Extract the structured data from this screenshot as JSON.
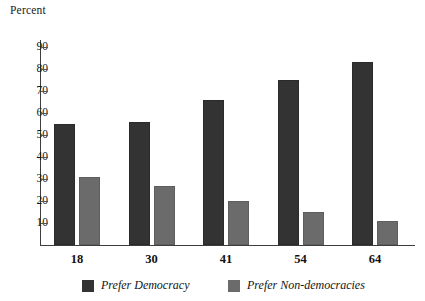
{
  "chart_data": {
    "type": "bar",
    "title": "",
    "ylabel": "Percent",
    "xlabel": "",
    "categories": [
      "18",
      "30",
      "41",
      "54",
      "64"
    ],
    "series": [
      {
        "name": "Prefer Democracy",
        "color": "#333333",
        "values": [
          55,
          56,
          66,
          75,
          83
        ]
      },
      {
        "name": "Prefer Non-democracies",
        "color": "#6b6b6b",
        "values": [
          31,
          27,
          20,
          15,
          11
        ]
      }
    ],
    "ylim": [
      0,
      95
    ],
    "yticks": [
      10,
      20,
      30,
      40,
      50,
      60,
      70,
      80,
      90
    ],
    "ytick_labels": [
      "10",
      "20",
      "30",
      "40",
      "50",
      "60",
      "70",
      "80",
      "90"
    ],
    "grid": false,
    "legend_position": "bottom"
  },
  "axis": {
    "y_title": "Percent"
  },
  "legend": {
    "items": [
      {
        "label": "Prefer Democracy"
      },
      {
        "label": "Prefer Non-democracies"
      }
    ]
  }
}
